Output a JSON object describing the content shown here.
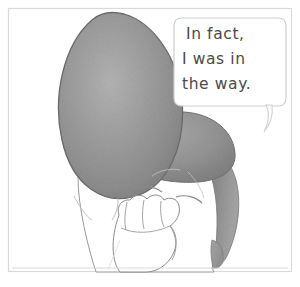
{
  "panel": {
    "name": "comic-panel",
    "medium": "pencil-sketch",
    "background_color": "#ffffff",
    "border_color": "#d8d8d8",
    "border_rect": {
      "x": 8,
      "y": 8,
      "width": 284,
      "height": 264
    }
  },
  "speech_bubble": {
    "shape": "rounded-rectangle",
    "outline_color": "#cfcfcf",
    "fill_color": "#ffffff",
    "tail_direction": "down-left",
    "lines": [
      "In fact,",
      "I was in",
      "the way."
    ],
    "full_text": "In fact, I was in the way.",
    "text_color": "#4a4a4a"
  },
  "figure": {
    "parts": [
      {
        "name": "hair-mass-large",
        "shade": "#9a9a9a"
      },
      {
        "name": "hair-mass-fringe",
        "shade": "#8e8e8e"
      },
      {
        "name": "hair-side-strand",
        "shade": "#8f8f8f"
      },
      {
        "name": "face",
        "shade": "#ffffff"
      },
      {
        "name": "hand",
        "shade": "#ffffff"
      },
      {
        "name": "ear",
        "shade": "#9b9b9b"
      }
    ],
    "pencil_line_color": "#6f6f6f",
    "ground_line_color": "#cccccc"
  }
}
